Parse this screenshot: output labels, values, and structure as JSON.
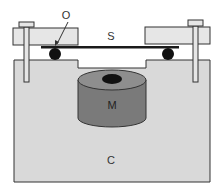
{
  "diagram": {
    "labels": {
      "O": "O",
      "S": "S",
      "M": "M",
      "C": "C"
    },
    "colors": {
      "background": "#ffffff",
      "base_fill": "#d9d9d9",
      "block_fill": "#e6e6e6",
      "outline": "#333333",
      "magnet_side": "#7a7a7a",
      "magnet_top": "#8e8e8e",
      "ball": "#111111",
      "beam": "#1a1a1a"
    },
    "components": [
      {
        "id": "O",
        "description": "pointer to contact point of beam on ball"
      },
      {
        "id": "S",
        "description": "sample beam"
      },
      {
        "id": "M",
        "description": "cylindrical magnet"
      },
      {
        "id": "C",
        "description": "base housing"
      }
    ]
  }
}
